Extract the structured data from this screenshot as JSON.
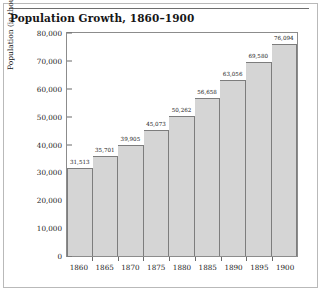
{
  "chart_data": {
    "type": "bar",
    "title": "Population Growth, 1860–1900",
    "xlabel": "",
    "ylabel": "Population (in thousands)",
    "categories": [
      "1860",
      "1865",
      "1870",
      "1875",
      "1880",
      "1885",
      "1890",
      "1895",
      "1900"
    ],
    "values": [
      31513,
      35701,
      39905,
      45073,
      50262,
      56658,
      63056,
      69580,
      76094
    ],
    "value_labels": [
      "31,513",
      "35,701",
      "39,905",
      "45,073",
      "50,262",
      "56,658",
      "63,056",
      "69,580",
      "76,094"
    ],
    "ylim": [
      0,
      80000
    ],
    "ytick_values": [
      0,
      10000,
      20000,
      30000,
      40000,
      50000,
      60000,
      70000,
      80000
    ],
    "ytick_labels": [
      "0",
      "10,000",
      "20,000",
      "30,000",
      "40,000",
      "50,000",
      "60,000",
      "70,000",
      "80,000"
    ],
    "grid": false,
    "legend": "none",
    "bar_fill_color": "#d5d5d5",
    "bar_border_color": "#7d7d7d",
    "axis_color": "#8c8c8c",
    "text_color": "#1a1a1a"
  }
}
